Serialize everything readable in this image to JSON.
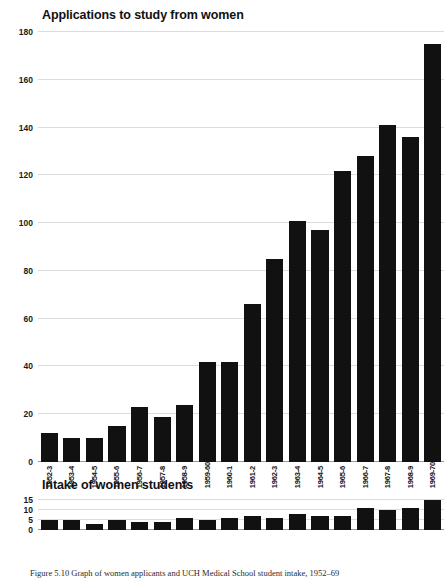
{
  "caption": "Figure 5.10   Graph of women applicants and UCH Medical School student intake, 1952–69",
  "chart_data": [
    {
      "type": "bar",
      "title": "Applications to study from women",
      "xlabel": "",
      "ylabel": "",
      "ylim": [
        0,
        180
      ],
      "yticks": [
        0,
        20,
        40,
        60,
        80,
        100,
        120,
        140,
        160,
        180
      ],
      "grid": true,
      "legend": "none",
      "bar_color": "#111111",
      "categories": [
        "1952-3",
        "1953-4",
        "1954-5",
        "1955-6",
        "1956-7",
        "1957-8",
        "1958-9",
        "1959-60",
        "1960-1",
        "1961-2",
        "1962-3",
        "1963-4",
        "1964-5",
        "1965-6",
        "1966-7",
        "1967-8",
        "1968-9",
        "1969-70"
      ],
      "values": [
        12,
        10,
        10,
        15,
        23,
        19,
        24,
        42,
        42,
        66,
        85,
        101,
        97,
        122,
        128,
        141,
        136,
        175
      ]
    },
    {
      "type": "bar",
      "title": "Intake of women students",
      "xlabel": "",
      "ylabel": "",
      "ylim": [
        0,
        15
      ],
      "yticks": [
        0,
        5,
        10,
        15
      ],
      "grid": true,
      "legend": "none",
      "bar_color": "#111111",
      "categories": [
        "1952-3",
        "1953-4",
        "1954-5",
        "1955-6",
        "1956-7",
        "1957-8",
        "1958-9",
        "1959-60",
        "1960-1",
        "1961-2",
        "1962-3",
        "1963-4",
        "1964-5",
        "1965-6",
        "1966-7",
        "1967-8",
        "1968-9",
        "1969-70"
      ],
      "values": [
        5,
        5,
        3,
        5,
        4,
        4,
        6,
        5,
        6,
        7,
        6,
        8,
        7,
        7,
        11,
        10,
        11,
        15
      ]
    }
  ]
}
